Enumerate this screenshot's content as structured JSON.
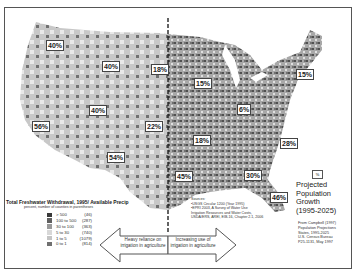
{
  "map": {
    "title": "Total Freshwater Withdrawal, 1995/ Available Precip",
    "subtitle": "percent, number of counties in parentheses",
    "legend": [
      {
        "range": "> 500",
        "count": "(46)",
        "color": "#3a3a3a"
      },
      {
        "range": "100 to 500",
        "count": "(287)",
        "color": "#606060"
      },
      {
        "range": "30 to 100",
        "count": "(363)",
        "color": "#9a9a9a"
      },
      {
        "range": "5 to 30",
        "count": "(740)",
        "color": "#d8d8d8"
      },
      {
        "range": "1 to 5",
        "count": "(1079)",
        "color": "#c4c4c4"
      },
      {
        "range": "0 to 1",
        "count": "(814)",
        "color": "#707070"
      }
    ],
    "growth_labels": [
      {
        "label": "40%",
        "x": 46,
        "y": 40
      },
      {
        "label": "40%",
        "x": 102,
        "y": 61
      },
      {
        "label": "18%",
        "x": 151,
        "y": 64
      },
      {
        "label": "15%",
        "x": 194,
        "y": 78
      },
      {
        "label": "15%",
        "x": 296,
        "y": 69
      },
      {
        "label": "40%",
        "x": 89,
        "y": 105
      },
      {
        "label": "56%",
        "x": 32,
        "y": 121
      },
      {
        "label": "22%",
        "x": 145,
        "y": 121
      },
      {
        "label": "6%",
        "x": 237,
        "y": 104
      },
      {
        "label": "18%",
        "x": 193,
        "y": 135
      },
      {
        "label": "28%",
        "x": 280,
        "y": 138
      },
      {
        "label": "54%",
        "x": 107,
        "y": 152
      },
      {
        "label": "45%",
        "x": 175,
        "y": 171
      },
      {
        "label": "30%",
        "x": 244,
        "y": 170
      },
      {
        "label": "46%",
        "x": 270,
        "y": 192
      }
    ],
    "arrows": {
      "left": "Heavy reliance on irrigation in agriculture",
      "right": "Increasing use of irrigation in agriculture"
    },
    "sources": [
      "Sources:",
      "•USGS Circular 1200 (Year 1995)",
      "•EPRI 2003, A Survey of Water Use",
      "Irrigation Resources and Water Costs,",
      "USDA/ERS, AREI, EIB-16, Chapter 2.1, 2006"
    ],
    "population": {
      "symbol": "%",
      "title_lines": [
        "Projected",
        "Population",
        "Growth",
        "(1995-2025)"
      ],
      "source_lines": [
        "From Campbell (1997)",
        "Population Projections",
        "States, 1995-2025",
        "U.S. Census Bureau",
        "P25-1131, May 1997"
      ]
    }
  }
}
